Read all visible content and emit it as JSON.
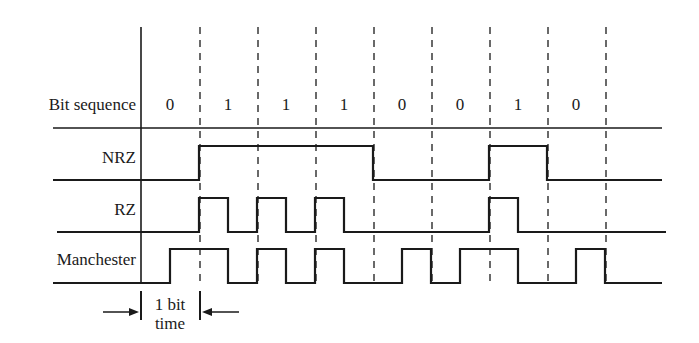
{
  "diagram": {
    "row_labels": {
      "bit_sequence": "Bit sequence",
      "nrz": "NRZ",
      "rz": "RZ",
      "manchester": "Manchester"
    },
    "bits": [
      "0",
      "1",
      "1",
      "1",
      "0",
      "0",
      "1",
      "0"
    ],
    "bit_time_label_line1": "1 bit",
    "bit_time_label_line2": "time",
    "colors": {
      "line": "#1a1a1a",
      "background": "#ffffff"
    },
    "layout": {
      "axis_x": 141,
      "first_dash_x": 200,
      "bit_width": 58,
      "dash_count": 8,
      "line_start_x": 53,
      "line_end_x": 662,
      "top_y": 27,
      "bitseq_baseline_y": 128,
      "nrz": {
        "high": 146,
        "low": 180
      },
      "rz": {
        "high": 198,
        "low": 232
      },
      "manchester": {
        "high": 249,
        "low": 283
      }
    },
    "waveforms": {
      "nrz_description": "High during each 1 bit, low during each 0 bit",
      "rz_description": "High for first half of each 1 bit, returns to zero",
      "manchester_description": "0 = low-to-high at mid-bit, 1 = high-to-low at mid-bit"
    }
  }
}
